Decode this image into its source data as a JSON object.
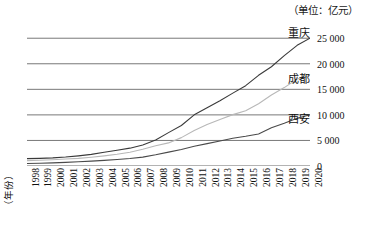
{
  "unit_note": "（单位：亿元）",
  "xaxis_title": "（年份）",
  "chart_data": {
    "type": "line",
    "title": "",
    "subtitle": "",
    "xlabel": "（年份）",
    "ylabel": "",
    "unit": "（单位：亿元）",
    "grid": true,
    "legend_position": "inline-right",
    "xlim": [
      1998,
      2020
    ],
    "ylim": [
      0,
      27000
    ],
    "yticks": [
      0,
      5000,
      10000,
      15000,
      20000,
      25000
    ],
    "ytick_labels": [
      "0",
      "5 000",
      "10 000",
      "15 000",
      "20 000",
      "25 000"
    ],
    "x": [
      1998,
      1999,
      2000,
      2001,
      2002,
      2003,
      2004,
      2005,
      2006,
      2007,
      2008,
      2009,
      2010,
      2011,
      2012,
      2013,
      2014,
      2015,
      2016,
      2017,
      2018,
      2019,
      2020
    ],
    "xtick_labels": [
      "1998",
      "1999",
      "2000",
      "2001",
      "2002",
      "2003",
      "2004",
      "2005",
      "2006",
      "2007",
      "2008",
      "2009",
      "2010",
      "2011",
      "2012",
      "2013",
      "2014",
      "2015",
      "2016",
      "2017",
      "2018",
      "2019",
      "2020"
    ],
    "series": [
      {
        "name": "重庆",
        "color": "#3a3a3a",
        "values": [
          1440,
          1490,
          1590,
          1750,
          1990,
          2270,
          2690,
          3070,
          3490,
          4120,
          5090,
          6530,
          7930,
          10011,
          11410,
          12780,
          14260,
          15720,
          17740,
          19420,
          21590,
          23605,
          25002
        ]
      },
      {
        "name": "成都",
        "color": "#b8b8b8",
        "values": [
          1050,
          1120,
          1230,
          1360,
          1500,
          1720,
          1990,
          2290,
          2700,
          3280,
          3960,
          4520,
          5550,
          6950,
          8130,
          9110,
          10050,
          10800,
          12170,
          13890,
          15340,
          17012,
          17717
        ]
      },
      {
        "name": "西安",
        "color": "#4a4a4a",
        "values": [
          500,
          550,
          620,
          710,
          820,
          950,
          1100,
          1270,
          1470,
          1740,
          2190,
          2720,
          3240,
          3860,
          4370,
          4880,
          5420,
          5810,
          6260,
          7470,
          8350,
          9321,
          10020
        ]
      }
    ]
  }
}
